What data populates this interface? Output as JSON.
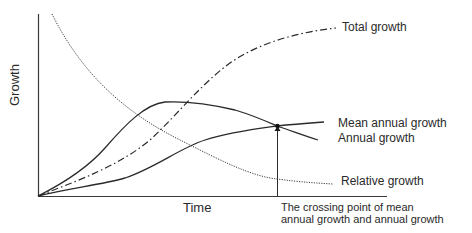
{
  "diagram": {
    "axes": {
      "y_label": "Growth",
      "x_label": "Time"
    },
    "curves": [
      {
        "name": "Total growth",
        "style": "dash-dot"
      },
      {
        "name": "Mean annual growth",
        "style": "solid"
      },
      {
        "name": "Annual growth",
        "style": "solid"
      },
      {
        "name": "Relative growth",
        "style": "dotted"
      }
    ],
    "labels": {
      "total": "Total growth",
      "mean": "Mean annual growth",
      "annual": "Annual growth",
      "relative": "Relative growth",
      "crossing_line1": "The crossing point of mean",
      "crossing_line2": "annual growth and annual growth"
    },
    "colors": {
      "line": "#2a2a2a",
      "background": "#ffffff"
    }
  }
}
